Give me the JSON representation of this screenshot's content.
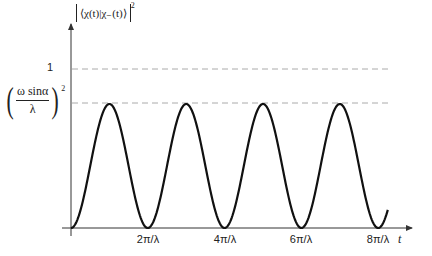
{
  "chart_data": {
    "type": "line",
    "title": "",
    "xlabel": "t",
    "ylabel": "|⟨χ(t)|χ₋(t)⟩|²",
    "x_ticks": [
      "2π/λ",
      "4π/λ",
      "6π/λ",
      "8π/λ"
    ],
    "x_tick_values_in_units_of_pi_over_lambda": [
      2,
      4,
      6,
      8
    ],
    "y_reference_lines": [
      {
        "label": "1",
        "value": 1.0,
        "style": "dashed"
      },
      {
        "label": "(ω sinα / λ)²",
        "value": 0.78,
        "style": "dashed"
      }
    ],
    "series": [
      {
        "name": "|⟨χ(t)|χ₋(t)⟩|²",
        "formula": "(ω sinα/λ)² · sin²(λt/2)",
        "x_in_units_of_pi_over_lambda": [
          0,
          1,
          2,
          3,
          4,
          5,
          6,
          7,
          8,
          8.25
        ],
        "values": [
          0,
          0.78,
          0,
          0.78,
          0,
          0.78,
          0,
          0.78,
          0,
          0.07
        ]
      }
    ],
    "grid": false,
    "legend": "none",
    "xlim_in_units_of_pi_over_lambda": [
      0,
      8.6
    ],
    "ylim": [
      0,
      1.25
    ]
  },
  "labels": {
    "y_axis_title_inner": "⟨χ(t)|χ₋(t)⟩",
    "y_axis_title_power": "2",
    "x_axis_title": "t",
    "one_label": "1",
    "peak_num": "ω sinα",
    "peak_den": "λ",
    "peak_pow": "2",
    "ticks": [
      "2π/λ",
      "4π/λ",
      "6π/λ",
      "8π/λ"
    ]
  },
  "colors": {
    "curve": "#111111",
    "axes": "#333333",
    "dashed": "#aaaaaa",
    "text": "#222222"
  }
}
